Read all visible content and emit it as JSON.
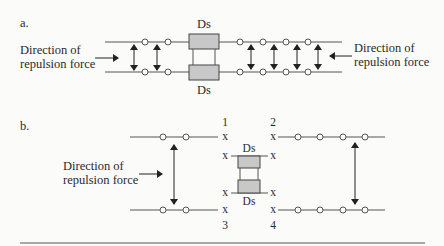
{
  "figure": {
    "part_a": {
      "label": "a.",
      "left_text": [
        "Direction of",
        "repulsion force"
      ],
      "right_text": [
        "Direction of",
        "repulsion force"
      ],
      "ds_top": "Ds",
      "ds_bottom": "Ds",
      "left_circles_per_line": 2,
      "right_circles_per_line": 4,
      "left_arrows": 2,
      "right_arrows": 4
    },
    "part_b": {
      "label": "b.",
      "left_text": [
        "Direction of",
        "repulsion force"
      ],
      "ds_top": "Ds",
      "ds_bottom": "Ds",
      "corner_labels": [
        "1",
        "2",
        "3",
        "4"
      ],
      "x_mark": "x",
      "left_circles_per_line": 2,
      "right_circles_per_line": 4
    }
  },
  "colors": {
    "background": "#fbfbfa",
    "line": "#555555",
    "desmosome_fill": "#c8c8c8",
    "text": "#2a2a2a"
  }
}
